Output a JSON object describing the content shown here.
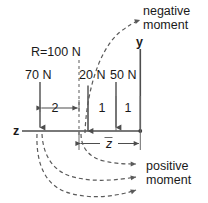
{
  "figure": {
    "axes": {
      "horizontal_label": "z",
      "vertical_label": "y"
    },
    "resultant": {
      "label": "R=100 N",
      "value": 100,
      "unit": "N"
    },
    "forces": [
      {
        "label": "70 N",
        "magnitude": 70,
        "unit": "N",
        "direction": "down",
        "position": 0
      },
      {
        "label": "20 N",
        "magnitude": 20,
        "unit": "N",
        "direction": "up",
        "position": 3
      },
      {
        "label": "50 N",
        "magnitude": 50,
        "unit": "N",
        "direction": "down",
        "position": 4
      }
    ],
    "dimensions": [
      {
        "label": "2",
        "value": 2
      },
      {
        "label": "1",
        "value": 1
      },
      {
        "label": "1",
        "value": 1
      }
    ],
    "centroid_dimension": {
      "label": "z",
      "overbar": true
    },
    "moment_signs": {
      "negative_line1": "negative",
      "negative_line2": "moment",
      "positive_line1": "positive",
      "positive_line2": "moment"
    },
    "colors": {
      "line": "#4d4d4d",
      "dashed": "#5a5a5a",
      "text": "#1a1a1a",
      "background": "#ffffff"
    }
  }
}
